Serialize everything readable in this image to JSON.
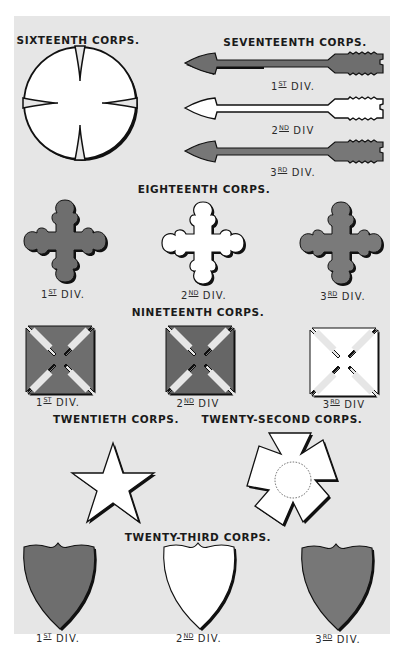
{
  "plate": {
    "background": "#e6e6e6",
    "colors": {
      "dark": "#6e6e6e",
      "medium": "#7a7a7a",
      "white": "#ffffff",
      "outline": "#111111"
    }
  },
  "corps": [
    {
      "title": "SIXTEENTH CORPS.",
      "insignia": "circle-cross",
      "divisions": []
    },
    {
      "title": "SEVENTEENTH CORPS.",
      "insignia": "arrow",
      "divisions": [
        {
          "num": "1",
          "suffix": "ST",
          "label": "DIV.",
          "color": "dark"
        },
        {
          "num": "2",
          "suffix": "ND",
          "label": "DIV",
          "color": "white"
        },
        {
          "num": "3",
          "suffix": "RD",
          "label": "DIV.",
          "color": "medium"
        }
      ]
    },
    {
      "title": "EIGHTEENTH CORPS.",
      "insignia": "cross-trefoil",
      "divisions": [
        {
          "num": "1",
          "suffix": "ST",
          "label": "DIV.",
          "color": "dark"
        },
        {
          "num": "2",
          "suffix": "ND",
          "label": "DIV.",
          "color": "white"
        },
        {
          "num": "3",
          "suffix": "RD",
          "label": "DIV.",
          "color": "medium"
        }
      ]
    },
    {
      "title": "NINETEENTH CORPS.",
      "insignia": "maltese-cross",
      "divisions": [
        {
          "num": "1",
          "suffix": "ST",
          "label": "DIV.",
          "color": "dark"
        },
        {
          "num": "2",
          "suffix": "ND",
          "label": "DIV",
          "color": "dark"
        },
        {
          "num": "3",
          "suffix": "RD",
          "label": "DIV",
          "color": "white"
        }
      ]
    },
    {
      "title": "TWENTIETH CORPS.",
      "insignia": "star",
      "divisions": []
    },
    {
      "title": "TWENTY-SECOND CORPS.",
      "insignia": "cross-quinquefoil",
      "divisions": []
    },
    {
      "title": "TWENTY-THIRD CORPS.",
      "insignia": "shield",
      "divisions": [
        {
          "num": "1",
          "suffix": "ST",
          "label": "DIV.",
          "color": "dark"
        },
        {
          "num": "2",
          "suffix": "ND",
          "label": "DIV.",
          "color": "white"
        },
        {
          "num": "3",
          "suffix": "RD",
          "label": "DIV.",
          "color": "medium"
        }
      ]
    }
  ]
}
